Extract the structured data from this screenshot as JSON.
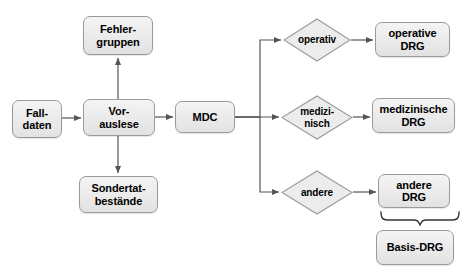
{
  "diagram": {
    "type": "flowchart",
    "title_visible": false,
    "colors": {
      "node_fill_top": "#f4f4f4",
      "node_fill_bottom": "#e2e2e2",
      "node_border": "#9a9a9a",
      "edge": "#555555",
      "text": "#000000",
      "background": "#ffffff"
    },
    "nodes": [
      {
        "id": "falldaten",
        "label": "Fall-\ndaten",
        "shape": "rounded-rect",
        "x": 12,
        "y": 100,
        "w": 50,
        "h": 38,
        "font_size": 11
      },
      {
        "id": "vorauslese",
        "label": "Vor-\nauslese",
        "shape": "rounded-rect",
        "x": 83,
        "y": 99,
        "w": 72,
        "h": 37,
        "font_size": 11
      },
      {
        "id": "fehlergruppen",
        "label": "Fehler-\ngruppen",
        "shape": "rounded-rect",
        "x": 83,
        "y": 16,
        "w": 70,
        "h": 39,
        "font_size": 11
      },
      {
        "id": "sondertat",
        "label": "Sondertat-\nbestände",
        "shape": "rounded-rect",
        "x": 79,
        "y": 176,
        "w": 79,
        "h": 37,
        "font_size": 11
      },
      {
        "id": "mdc",
        "label": "MDC",
        "shape": "rounded-rect",
        "x": 175,
        "y": 101,
        "w": 60,
        "h": 32,
        "font_size": 11
      },
      {
        "id": "operativ",
        "label": "operativ",
        "shape": "diamond",
        "x": 283,
        "y": 18,
        "w": 68,
        "h": 44,
        "font_size": 10
      },
      {
        "id": "medizinisch",
        "label": "medizi-\nnisch",
        "shape": "diamond",
        "x": 281,
        "y": 95,
        "w": 72,
        "h": 45,
        "font_size": 10
      },
      {
        "id": "andere",
        "label": "andere",
        "shape": "diamond",
        "x": 281,
        "y": 170,
        "w": 72,
        "h": 45,
        "font_size": 10
      },
      {
        "id": "operative_drg",
        "label": "operative\nDRG",
        "shape": "rounded-rect",
        "x": 375,
        "y": 22,
        "w": 75,
        "h": 35,
        "font_size": 11
      },
      {
        "id": "medizinische_drg",
        "label": "medizinische\nDRG",
        "shape": "rounded-rect",
        "x": 372,
        "y": 98,
        "w": 83,
        "h": 35,
        "font_size": 11
      },
      {
        "id": "andere_drg",
        "label": "andere\nDRG",
        "shape": "rounded-rect",
        "x": 378,
        "y": 174,
        "w": 72,
        "h": 34,
        "font_size": 11
      },
      {
        "id": "basis_drg",
        "label": "Basis-DRG",
        "shape": "rounded-rect",
        "x": 376,
        "y": 230,
        "w": 78,
        "h": 35,
        "font_size": 11
      }
    ],
    "edges": [
      {
        "from": "falldaten",
        "to": "vorauslese",
        "kind": "arrow-right"
      },
      {
        "from": "vorauslese",
        "to": "fehlergruppen",
        "kind": "arrow-up"
      },
      {
        "from": "vorauslese",
        "to": "sondertat",
        "kind": "arrow-down"
      },
      {
        "from": "vorauslese",
        "to": "mdc",
        "kind": "arrow-right"
      },
      {
        "from": "mdc",
        "to": "operativ",
        "kind": "arrow-branch-up"
      },
      {
        "from": "mdc",
        "to": "medizinisch",
        "kind": "arrow-branch-straight"
      },
      {
        "from": "mdc",
        "to": "andere",
        "kind": "arrow-branch-down"
      },
      {
        "from": "operativ",
        "to": "operative_drg",
        "kind": "arrow-right"
      },
      {
        "from": "medizinisch",
        "to": "medizinische_drg",
        "kind": "arrow-right"
      },
      {
        "from": "andere",
        "to": "andere_drg",
        "kind": "arrow-right"
      },
      {
        "from": "andere_drg",
        "to": "basis_drg",
        "kind": "brace"
      }
    ],
    "brace": {
      "x_left": 380,
      "x_right": 460,
      "y_top": 212,
      "y_point": 225,
      "tip_x": 420
    }
  }
}
